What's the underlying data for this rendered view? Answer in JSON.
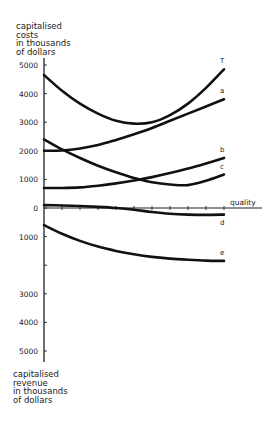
{
  "chart_data": {
    "type": "line",
    "title": "",
    "xlabel": "quality",
    "ylabel_top": [
      "capitalised",
      "costs",
      "in thousands",
      "of dollars"
    ],
    "ylabel_bottom": [
      "capitalised",
      "revenue",
      "in thousands",
      "of dollars"
    ],
    "y_ticks_up": [
      "5000",
      "4000",
      "3000",
      "2000",
      "1000",
      "0"
    ],
    "y_ticks_down": [
      "1000",
      "",
      "3000",
      "4000",
      "5000"
    ],
    "ylim": [
      -5000,
      5000
    ],
    "grid": false,
    "legend": "inline curve labels",
    "x": [
      0,
      1,
      2,
      3,
      4,
      5,
      6,
      7,
      8,
      9,
      10
    ],
    "series": [
      {
        "name": "T",
        "values": [
          4650,
          4100,
          3650,
          3300,
          3050,
          2950,
          3000,
          3250,
          3650,
          4200,
          4850
        ]
      },
      {
        "name": "a",
        "values": [
          2000,
          2010,
          2080,
          2200,
          2380,
          2580,
          2800,
          3050,
          3300,
          3550,
          3800
        ]
      },
      {
        "name": "b",
        "values": [
          700,
          700,
          720,
          780,
          860,
          960,
          1080,
          1220,
          1380,
          1560,
          1750
        ]
      },
      {
        "name": "c",
        "values": [
          2400,
          2050,
          1750,
          1480,
          1250,
          1050,
          900,
          820,
          800,
          950,
          1170
        ]
      },
      {
        "name": "d",
        "values": [
          100,
          90,
          70,
          40,
          0,
          -60,
          -140,
          -200,
          -230,
          -240,
          -230
        ]
      },
      {
        "name": "e",
        "values": [
          -600,
          -900,
          -1150,
          -1350,
          -1500,
          -1620,
          -1710,
          -1770,
          -1810,
          -1840,
          -1850
        ]
      }
    ]
  }
}
